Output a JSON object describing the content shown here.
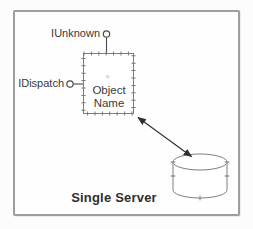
{
  "diagram": {
    "caption": "Single Server",
    "interface_top": {
      "label": "IUnknown"
    },
    "interface_side": {
      "label": "IDispatch"
    },
    "com_object": {
      "name_line1": "Object",
      "name_line2": "Name",
      "anchor_mark": "×"
    },
    "icons": {
      "interface_top_icon": "lollipop-interface",
      "interface_side_icon": "lollipop-interface",
      "datastore_icon": "database-cylinder",
      "link_icon": "double-headed-arrow"
    },
    "colors": {
      "frame_border": "#9e9e9e",
      "shape_line": "#6f6f6f",
      "tick": "#787878",
      "stem_line": "#4a4a4a",
      "arrow": "#2e2e2e",
      "text": "#383838",
      "anchor_mark": "#b8b8b8",
      "background": "#fefefe"
    }
  }
}
